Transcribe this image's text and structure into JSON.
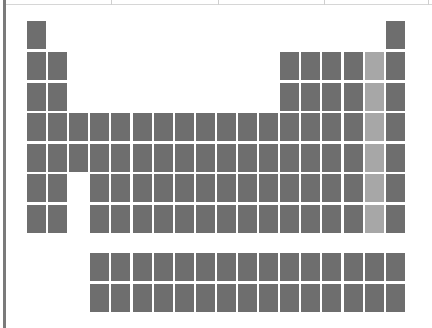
{
  "colors": {
    "cell": "#6e6e6e",
    "highlight": "#a7a7a7",
    "background": "#ffffff",
    "left_bar": "#7a7a7a"
  },
  "layout": {
    "origin_x": 27,
    "col_pitch": 21.1,
    "row_y": [
      21,
      52,
      83,
      113,
      144,
      174,
      205
    ],
    "f_block_y": [
      253,
      284
    ],
    "f_block_start_col": 4,
    "f_block_count": 15
  },
  "top_strip": {
    "dividers_x": [
      111,
      218,
      324,
      428
    ]
  },
  "periodic_table": {
    "highlighted_group": 17,
    "rows": [
      {
        "period": 1,
        "columns": [
          1,
          18
        ]
      },
      {
        "period": 2,
        "columns": [
          1,
          2,
          13,
          14,
          15,
          16,
          17,
          18
        ]
      },
      {
        "period": 3,
        "columns": [
          1,
          2,
          13,
          14,
          15,
          16,
          17,
          18
        ]
      },
      {
        "period": 4,
        "columns": [
          1,
          2,
          3,
          4,
          5,
          6,
          7,
          8,
          9,
          10,
          11,
          12,
          13,
          14,
          15,
          16,
          17,
          18
        ]
      },
      {
        "period": 5,
        "columns": [
          1,
          2,
          3,
          4,
          5,
          6,
          7,
          8,
          9,
          10,
          11,
          12,
          13,
          14,
          15,
          16,
          17,
          18
        ]
      },
      {
        "period": 6,
        "columns": [
          1,
          2,
          4,
          5,
          6,
          7,
          8,
          9,
          10,
          11,
          12,
          13,
          14,
          15,
          16,
          17,
          18
        ]
      },
      {
        "period": 7,
        "columns": [
          1,
          2,
          4,
          5,
          6,
          7,
          8,
          9,
          10,
          11,
          12,
          13,
          14,
          15,
          16,
          17,
          18
        ]
      }
    ],
    "f_block": [
      {
        "series": "lanthanides",
        "count": 15
      },
      {
        "series": "actinides",
        "count": 15
      }
    ]
  }
}
